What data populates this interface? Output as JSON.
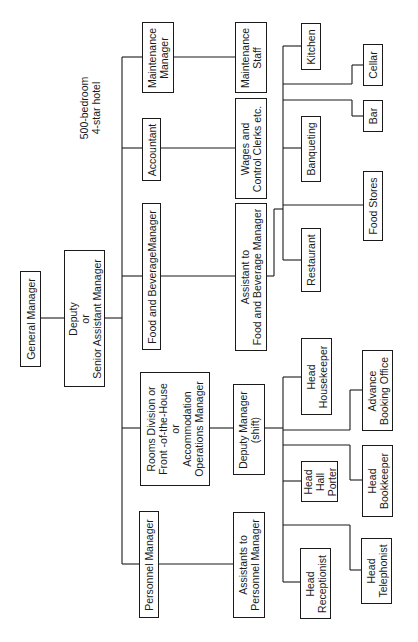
{
  "diagram": {
    "type": "organisation-chart",
    "orientation": "rotated-90-ccw",
    "note": "500-bedroom\n4-star hotel",
    "nodes": {
      "general_manager": "General Manager",
      "deputy": "Deputy\nor\nSenior Assistant Manager",
      "maintenance_manager": "Maintenance\nManager",
      "accountant": "Accountant",
      "fb_manager": "Food and BeverageManager",
      "rooms_division": "Rooms Division or\nFront -of-the-House\nor\nAccommodation\nOperations Manager",
      "personnel_manager": "Personnel Manager",
      "maintenance_staff": "Maintenance\nStaff",
      "wages_clerks": "Wages and\nControl Clerks etc.",
      "assistant_fb": "Assistant to\nFood and Beverage Manager",
      "deputy_manager_shift": "Deputy Manager\n(shift)",
      "assistants_personnel": "Assistants to\nPersonnel Manager",
      "kitchen": "Kitchen",
      "banqueting": "Banqueting",
      "restaurant": "Restaurant",
      "cellar": "Cellar",
      "bar": "Bar",
      "food_stores": "Food Stores",
      "head_housekeeper": "Head\nHousekeeper",
      "head_hall_porter": "Head\nHall\nPorter",
      "head_receptionist": "Head\nReceptionist",
      "advance_booking": "Advance\nBooking Office",
      "head_bookkeeper": "Head\nBookkeeper",
      "head_telephonist": "Head\nTelephonist"
    }
  }
}
